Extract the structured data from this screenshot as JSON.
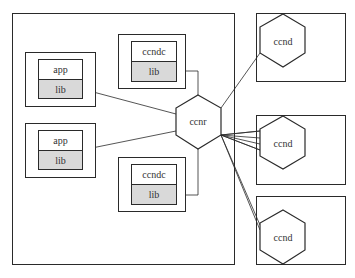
{
  "diagram": {
    "colors": {
      "stroke": "#2a2a2a",
      "lib_fill": "#d9d9d9",
      "bg": "#ffffff"
    },
    "apps": [
      {
        "app_label": "app",
        "lib_label": "lib"
      },
      {
        "app_label": "app",
        "lib_label": "lib"
      }
    ],
    "ccndcs": [
      {
        "label": "ccndc",
        "lib_label": "lib"
      },
      {
        "label": "ccndc",
        "lib_label": "lib"
      }
    ],
    "router": {
      "label": "ccnr"
    },
    "daemons": [
      {
        "label": "ccnd"
      },
      {
        "label": "ccnd"
      },
      {
        "label": "ccnd"
      }
    ]
  }
}
